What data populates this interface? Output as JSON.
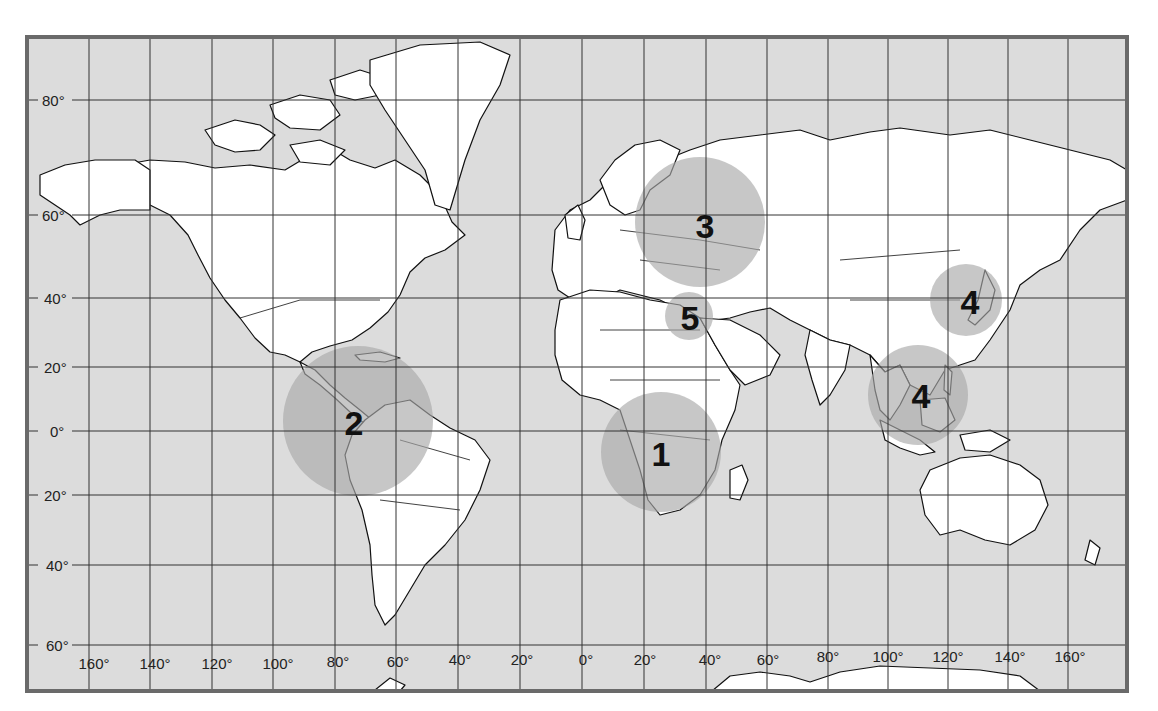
{
  "map": {
    "title": "",
    "projection": "Mercator",
    "colors": {
      "ocean": "#dcdcdc",
      "land": "#ffffff",
      "border": "#111111",
      "grid": "#333333",
      "frame": "#6a6a6a",
      "highlight_circle": "#a9a9a9"
    },
    "latitude_labels": [
      "80°",
      "60°",
      "40°",
      "20°",
      "0°",
      "-20°",
      "-40°",
      "-60°"
    ],
    "latitude_labels_display": [
      "80°",
      "60°",
      "40°",
      "20°",
      "0°",
      "20°",
      "40°",
      "60°"
    ],
    "longitude_labels": [
      "160°",
      "140°",
      "120°",
      "100°",
      "80°",
      "60°",
      "40°",
      "20°",
      "0°",
      "20°",
      "40°",
      "60°",
      "80°",
      "100°",
      "120°",
      "140°",
      "160°"
    ],
    "markers": [
      {
        "id": "1",
        "label": "1",
        "region": "Central & Southern Africa"
      },
      {
        "id": "2",
        "label": "2",
        "region": "Northern South America / Central America / Caribbean"
      },
      {
        "id": "3",
        "label": "3",
        "region": "Eastern Europe / Western Russia"
      },
      {
        "id": "4a",
        "label": "4",
        "region": "Korea / Northeast China / Japan"
      },
      {
        "id": "4b",
        "label": "4",
        "region": "Southeast Asia"
      },
      {
        "id": "5",
        "label": "5",
        "region": "Eastern Mediterranean / Middle East"
      }
    ]
  }
}
